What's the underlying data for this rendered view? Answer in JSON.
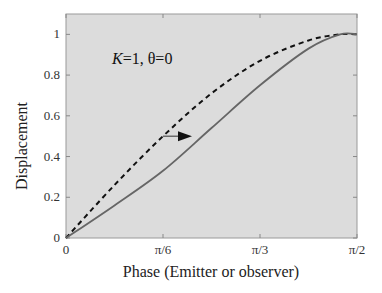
{
  "chart_data": {
    "type": "line",
    "title": "",
    "xlabel": "Phase (Emitter or observer)",
    "ylabel": "Displacement",
    "annotation": "K=1, θ=0",
    "annotation_parts": {
      "k": "K",
      "rest": "=1, θ=0"
    },
    "xlim": [
      0,
      1.5708
    ],
    "ylim": [
      0,
      1.1
    ],
    "grid": false,
    "legend": null,
    "x_ticks": [
      {
        "value": 0,
        "label": "0"
      },
      {
        "value": 0.5236,
        "label": "π/6"
      },
      {
        "value": 1.0472,
        "label": "π/3"
      },
      {
        "value": 1.5708,
        "label": "π/2"
      }
    ],
    "y_ticks": [
      {
        "value": 0,
        "label": "0"
      },
      {
        "value": 0.2,
        "label": "0.2"
      },
      {
        "value": 0.4,
        "label": "0.4"
      },
      {
        "value": 0.6,
        "label": "0.6"
      },
      {
        "value": 0.8,
        "label": "0.8"
      },
      {
        "value": 1.0,
        "label": "1"
      }
    ],
    "x": [
      0,
      0.2618,
      0.5236,
      0.7854,
      1.0472,
      1.309,
      1.48,
      1.5708
    ],
    "series": [
      {
        "name": "emitter (dashed)",
        "style": "dashed",
        "color": "#111111",
        "values": [
          0,
          0.26,
          0.5,
          0.71,
          0.87,
          0.97,
          1.0,
          1.0
        ]
      },
      {
        "name": "observer (solid)",
        "style": "solid",
        "color": "#666666",
        "values": [
          0,
          0.16,
          0.33,
          0.54,
          0.75,
          0.93,
          1.0,
          1.0
        ]
      }
    ],
    "arrow": {
      "from": {
        "x": 0.5236,
        "y": 0.5
      },
      "to": {
        "x": 0.68,
        "y": 0.5
      },
      "direction": "right"
    },
    "colors": {
      "plot_background": "#dcdcdc",
      "frame": "#999999"
    }
  }
}
